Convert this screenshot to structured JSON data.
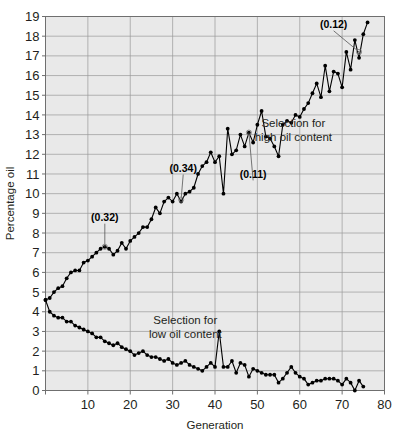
{
  "chart_data": {
    "type": "line",
    "title": "",
    "xlabel": "Generation",
    "ylabel": "Percentage oil",
    "xlim": [
      0,
      80
    ],
    "ylim": [
      0,
      19
    ],
    "xticks": [
      0,
      10,
      20,
      30,
      40,
      50,
      60,
      70,
      80
    ],
    "xtick_labels": [
      "",
      "10",
      "20",
      "30",
      "40",
      "50",
      "60",
      "70",
      "80"
    ],
    "yticks": [
      0,
      1,
      2,
      3,
      4,
      5,
      6,
      7,
      8,
      9,
      10,
      11,
      12,
      13,
      14,
      15,
      16,
      17,
      18,
      19
    ],
    "ytick_labels": [
      "0",
      "1",
      "2",
      "3",
      "4",
      "5",
      "6",
      "7",
      "8",
      "9",
      "10",
      "11",
      "12",
      "13",
      "14",
      "15",
      "16",
      "17",
      "18",
      "19"
    ],
    "grid": true,
    "grid_color": "#9a9a9a",
    "plot_background": "#e9e9e9",
    "marker": "filled-circle",
    "marker_color": "#000000",
    "line_color": "#000000",
    "legend_position": "none",
    "series": [
      {
        "name": "Selection for high oil content",
        "x": [
          0,
          1,
          2,
          3,
          4,
          5,
          6,
          7,
          8,
          9,
          10,
          11,
          12,
          13,
          14,
          15,
          16,
          17,
          18,
          19,
          20,
          21,
          22,
          23,
          24,
          25,
          26,
          27,
          28,
          29,
          30,
          31,
          32,
          33,
          34,
          35,
          36,
          37,
          38,
          39,
          40,
          41,
          42,
          43,
          44,
          45,
          46,
          47,
          48,
          49,
          50,
          51,
          52,
          53,
          54,
          55,
          56,
          57,
          58,
          59,
          60,
          61,
          62,
          63,
          64,
          65,
          66,
          67,
          68,
          69,
          70,
          71,
          72,
          73,
          74,
          75,
          76
        ],
        "values": [
          4.6,
          4.7,
          5.0,
          5.2,
          5.3,
          5.7,
          6.0,
          6.1,
          6.1,
          6.5,
          6.6,
          6.8,
          7.0,
          7.2,
          7.3,
          7.2,
          6.9,
          7.1,
          7.5,
          7.2,
          7.6,
          7.8,
          8.0,
          8.3,
          8.3,
          8.7,
          9.3,
          9.0,
          9.6,
          9.8,
          9.6,
          10.0,
          9.6,
          10.0,
          10.1,
          10.3,
          11.0,
          11.4,
          11.6,
          12.1,
          11.6,
          11.9,
          10.0,
          13.3,
          12.0,
          12.2,
          13.0,
          12.4,
          13.1,
          12.6,
          13.5,
          14.2,
          12.9,
          12.8,
          12.4,
          11.9,
          13.5,
          13.7,
          13.6,
          14.0,
          13.9,
          14.3,
          14.6,
          15.1,
          15.6,
          14.9,
          16.5,
          15.2,
          16.2,
          16.1,
          15.4,
          17.2,
          16.3,
          17.8,
          16.9,
          18.1,
          18.7
        ]
      },
      {
        "name": "Selection for low oil content",
        "x": [
          0,
          1,
          2,
          3,
          4,
          5,
          6,
          7,
          8,
          9,
          10,
          11,
          12,
          13,
          14,
          15,
          16,
          17,
          18,
          19,
          20,
          21,
          22,
          23,
          24,
          25,
          26,
          27,
          28,
          29,
          30,
          31,
          32,
          33,
          34,
          35,
          36,
          37,
          38,
          39,
          40,
          41,
          42,
          43,
          44,
          45,
          46,
          47,
          48,
          49,
          50,
          51,
          52,
          53,
          54,
          55,
          56,
          57,
          58,
          59,
          60,
          61,
          62,
          63,
          64,
          65,
          66,
          67,
          68,
          69,
          70,
          71,
          72,
          73,
          74,
          75
        ],
        "values": [
          4.6,
          4.0,
          3.8,
          3.7,
          3.7,
          3.5,
          3.5,
          3.3,
          3.2,
          3.1,
          3.0,
          2.9,
          2.7,
          2.7,
          2.5,
          2.4,
          2.3,
          2.4,
          2.2,
          2.1,
          2.0,
          1.8,
          1.9,
          2.0,
          1.8,
          1.7,
          1.7,
          1.6,
          1.5,
          1.6,
          1.4,
          1.3,
          1.4,
          1.5,
          1.3,
          1.2,
          1.1,
          1.0,
          1.2,
          1.4,
          1.2,
          3.0,
          1.2,
          1.2,
          1.5,
          0.9,
          1.4,
          1.3,
          0.7,
          1.1,
          1.0,
          0.9,
          0.8,
          0.8,
          0.8,
          0.4,
          0.6,
          0.9,
          1.2,
          0.9,
          0.7,
          0.6,
          0.3,
          0.4,
          0.5,
          0.5,
          0.6,
          0.6,
          0.6,
          0.5,
          0.3,
          0.6,
          0.4,
          0.0,
          0.5,
          0.2
        ]
      }
    ],
    "annotations": [
      {
        "label": "(0.32)",
        "x": 14,
        "y": 7.3,
        "text_x": 14,
        "text_y": 8.6
      },
      {
        "label": "(0.34)",
        "x": 32,
        "y": 9.7,
        "text_x": 32.5,
        "text_y": 11.1
      },
      {
        "label": "(0.11)",
        "x": 48,
        "y": 13.1,
        "text_x": 49,
        "text_y": 10.8
      },
      {
        "label": "(0.12)",
        "x": 74,
        "y": 17.2,
        "text_x": 68,
        "text_y": 18.4
      }
    ],
    "captions": [
      {
        "text_lines": [
          "Selection for",
          "high oil content"
        ],
        "x": 58.5,
        "y": 13.4
      },
      {
        "text_lines": [
          "Selection for",
          "low oil content"
        ],
        "x": 33,
        "y": 3.4
      }
    ]
  }
}
